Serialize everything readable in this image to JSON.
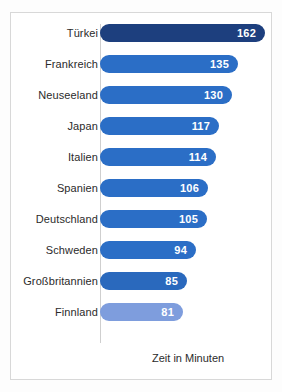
{
  "chart_data": {
    "type": "bar",
    "orientation": "horizontal",
    "title": "",
    "subtitle": "",
    "xlabel": "Zeit in Minuten",
    "ylabel": "",
    "grid": false,
    "legend": null,
    "xlim": [
      0,
      162
    ],
    "categories": [
      "Türkei",
      "Frankreich",
      "Neuseeland",
      "Japan",
      "Italien",
      "Spanien",
      "Deutschland",
      "Schweden",
      "Großbritannien",
      "Finnland"
    ],
    "values": [
      162,
      135,
      130,
      117,
      114,
      106,
      105,
      94,
      85,
      81
    ],
    "value_labels": [
      "162",
      "135",
      "130",
      "117",
      "114",
      "106",
      "105",
      "94",
      "85",
      "81"
    ],
    "bar_colors": [
      "#1d3f7e",
      "#2b6ec6",
      "#2b6ec6",
      "#2b6ec6",
      "#2b6ec6",
      "#2b6ec6",
      "#2b6ec6",
      "#2b6ec6",
      "#2a69bd",
      "#7e9ddd"
    ],
    "bars": [
      {
        "category": "Türkei",
        "value": 162,
        "label": "162",
        "color": "#1d3f7e"
      },
      {
        "category": "Frankreich",
        "value": 135,
        "label": "135",
        "color": "#2b6ec6"
      },
      {
        "category": "Neuseeland",
        "value": 130,
        "label": "130",
        "color": "#2b6ec6"
      },
      {
        "category": "Japan",
        "value": 117,
        "label": "117",
        "color": "#2b6ec6"
      },
      {
        "category": "Italien",
        "value": 114,
        "label": "114",
        "color": "#2b6ec6"
      },
      {
        "category": "Spanien",
        "value": 106,
        "label": "106",
        "color": "#2b6ec6"
      },
      {
        "category": "Deutschland",
        "value": 105,
        "label": "105",
        "color": "#2b6ec6"
      },
      {
        "category": "Schweden",
        "value": 94,
        "label": "94",
        "color": "#2b6ec6"
      },
      {
        "category": "Großbritannien",
        "value": 85,
        "label": "85",
        "color": "#2a69bd"
      },
      {
        "category": "Finnland",
        "value": 81,
        "label": "81",
        "color": "#7e9ddd"
      }
    ]
  },
  "axis": {
    "unit_label": "Zeit in Minuten"
  },
  "caption": {
    "cropped_text": ""
  },
  "colors": {
    "bar_primary": "#2b6ec6",
    "bar_highlight": "#1d3f7e",
    "bar_last": "#7e9ddd",
    "frame_border": "#d8d8d8",
    "axis_line": "#cfcfcf",
    "text": "#2b2b2b",
    "value_text": "#ffffff",
    "background": "#ffffff"
  }
}
